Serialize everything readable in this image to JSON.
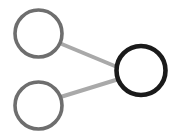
{
  "figure": {
    "name": "node-link-graph",
    "width": 178,
    "height": 137,
    "background_color": "#ffffff"
  },
  "chart_data": {
    "type": "diagram",
    "subtype": "node-link-graph",
    "title": "",
    "xlabel": "",
    "ylabel": "",
    "grid": false,
    "legend": null,
    "coordinate_space": "pixels",
    "xlim": [
      0,
      178
    ],
    "ylim": [
      0,
      137
    ],
    "nodes": [
      {
        "id": "node-top-left",
        "label": "",
        "cx": 38.5,
        "cy": 33.5,
        "r": 23.5,
        "stroke_color": "#6e6e6e",
        "stroke_width": 3.6,
        "fill_color": "#ffffff",
        "emphasis": "normal"
      },
      {
        "id": "node-bottom-left",
        "label": "",
        "cx": 38.5,
        "cy": 105.5,
        "r": 23.5,
        "stroke_color": "#6e6e6e",
        "stroke_width": 3.6,
        "fill_color": "#ffffff",
        "emphasis": "normal"
      },
      {
        "id": "node-right",
        "label": "",
        "cx": 141.0,
        "cy": 70.5,
        "r": 24.5,
        "stroke_color": "#1a1a1a",
        "stroke_width": 4.6,
        "fill_color": "#ffffff",
        "emphasis": "highlighted"
      }
    ],
    "edges": [
      {
        "id": "edge-top-left-to-right",
        "source": "node-top-left",
        "target": "node-right",
        "x1": 60.5,
        "y1": 43.5,
        "x2": 119.5,
        "y2": 68.0,
        "stroke_color": "#a9a9a9",
        "stroke_width": 4.0
      },
      {
        "id": "edge-bottom-left-to-right",
        "source": "node-bottom-left",
        "target": "node-right",
        "x1": 60.5,
        "y1": 97.0,
        "x2": 119.0,
        "y2": 79.0,
        "stroke_color": "#a9a9a9",
        "stroke_width": 4.0
      }
    ],
    "counts": {
      "node_count": 3,
      "edge_count": 2
    }
  }
}
